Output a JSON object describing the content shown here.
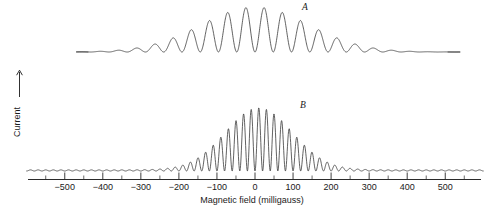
{
  "figure": {
    "background_color": "#ffffff",
    "curve_color": "#3a3a3a",
    "axis_color": "#2b2b2b",
    "text_color": "#1a1a1a"
  },
  "axes": {
    "x_caption": "Magnetic field (milligauss)",
    "y_caption": "Current",
    "y_arrow_icon": "up-arrow-icon",
    "x_tick_labels": [
      "-500",
      "-400",
      "-300",
      "-200",
      "-100",
      "0",
      "100",
      "200",
      "300",
      "400",
      "500"
    ],
    "x_tick_values": [
      -500,
      -400,
      -300,
      -200,
      -100,
      0,
      100,
      200,
      300,
      400,
      500
    ],
    "x_minor_tick_values": [
      -550,
      -450,
      -350,
      -250,
      -150,
      -50,
      50,
      150,
      250,
      350,
      450,
      550
    ],
    "x_min": -600,
    "x_max": 600
  },
  "labels": {
    "curve_a": "A",
    "curve_b": "B"
  },
  "chart_data": {
    "type": "line",
    "title": "",
    "xlabel": "Magnetic field (milligauss)",
    "ylabel": "Current",
    "xlim": [
      -600,
      600
    ],
    "grid": false,
    "legend_position": "inline-annotation",
    "series": [
      {
        "name": "A",
        "label_annotation": "A",
        "description": "Interference fringes: oscillation on a Gaussian envelope, lower fringe frequency, wide visible fringes",
        "envelope": "gaussian",
        "envelope_center": 0,
        "envelope_sigma": 200,
        "fringe_period_milligauss": 48,
        "fringe_phase": 0,
        "x_start": -470,
        "x_end": 540,
        "visible_fringe_count": 21,
        "baseline_amplitude": 0.0
      },
      {
        "name": "B",
        "label_annotation": "B",
        "description": "Interference fringes: oscillation on a Gaussian envelope, higher fringe frequency, narrower fringes with small persistent baseline ripple",
        "envelope": "gaussian",
        "envelope_center": 10,
        "envelope_sigma": 125,
        "fringe_period_milligauss": 20,
        "fringe_phase": 0,
        "x_start": -600,
        "x_end": 600,
        "visible_fringe_count": 50,
        "baseline_amplitude": 0.018
      }
    ]
  }
}
